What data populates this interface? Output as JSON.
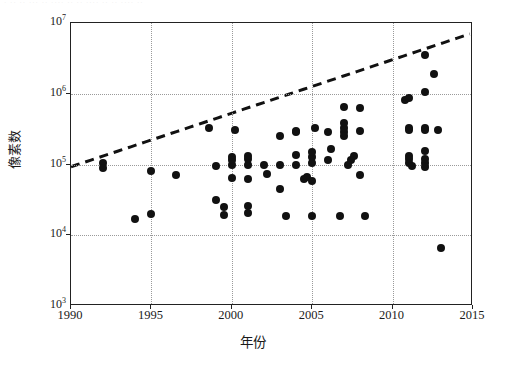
{
  "figure": {
    "scan_artifact_text": "· ·· ·· ··· ·· ···· ·· ·· ···· ·· ·· ···· ··",
    "title": "",
    "xlabel": "年份",
    "ylabel": "像素数"
  },
  "axis": {
    "x_ticks": [
      "1990",
      "1995",
      "2000",
      "2005",
      "2010",
      "2015"
    ],
    "y_ticks": [
      {
        "mantissa": "10",
        "exponent": "7"
      },
      {
        "mantissa": "10",
        "exponent": "6"
      },
      {
        "mantissa": "10",
        "exponent": "5"
      },
      {
        "mantissa": "10",
        "exponent": "4"
      },
      {
        "mantissa": "10",
        "exponent": "3"
      }
    ]
  },
  "chart_data": {
    "type": "scatter",
    "title": "",
    "xlabel": "年份",
    "ylabel": "像素数",
    "xlim": [
      1990,
      2015
    ],
    "ylim": [
      1000,
      10000000
    ],
    "yscale": "log",
    "xscale": "linear",
    "grid": true,
    "legend": null,
    "marker": {
      "shape": "circle",
      "color": "#111111",
      "size": 8
    },
    "series": [
      {
        "name": "像素数",
        "points": [
          [
            1992,
            105000
          ],
          [
            1992,
            88000
          ],
          [
            1994,
            17000
          ],
          [
            1995,
            82000
          ],
          [
            1995,
            20000
          ],
          [
            1996.5,
            70000
          ],
          [
            1998.6,
            330000
          ],
          [
            1999,
            96000
          ],
          [
            1999,
            31000
          ],
          [
            1999.5,
            19500
          ],
          [
            1999.5,
            25000
          ],
          [
            2000,
            100000
          ],
          [
            2000,
            115000
          ],
          [
            2000,
            128000
          ],
          [
            2000,
            64000
          ],
          [
            2000.2,
            310000
          ],
          [
            2001,
            100000
          ],
          [
            2001,
            118000
          ],
          [
            2001,
            132000
          ],
          [
            2001,
            62000
          ],
          [
            2001,
            20500
          ],
          [
            2001,
            26000
          ],
          [
            2002,
            98000
          ],
          [
            2002.2,
            73000
          ],
          [
            2003,
            100000
          ],
          [
            2003,
            250000
          ],
          [
            2003,
            45000
          ],
          [
            2003.4,
            19000
          ],
          [
            2004,
            97000
          ],
          [
            2004,
            290000
          ],
          [
            2004,
            135000
          ],
          [
            2004,
            300000
          ],
          [
            2004.5,
            63000
          ],
          [
            2004.7,
            67000
          ],
          [
            2005,
            105000
          ],
          [
            2005,
            128000
          ],
          [
            2005,
            152000
          ],
          [
            2005,
            59000
          ],
          [
            2005,
            19000
          ],
          [
            2005.2,
            330000
          ],
          [
            2006,
            290000
          ],
          [
            2006,
            115000
          ],
          [
            2006.2,
            168000
          ],
          [
            2006.7,
            18500
          ],
          [
            2007,
            640000
          ],
          [
            2007,
            290000
          ],
          [
            2007,
            330000
          ],
          [
            2007,
            380000
          ],
          [
            2007,
            250000
          ],
          [
            2007.2,
            100000
          ],
          [
            2007.4,
            115000
          ],
          [
            2007.6,
            132000
          ],
          [
            2008,
            620000
          ],
          [
            2008,
            300000
          ],
          [
            2008,
            70000
          ],
          [
            2008.3,
            18500
          ],
          [
            2010.8,
            820000
          ],
          [
            2011,
            880000
          ],
          [
            2011,
            330000
          ],
          [
            2011,
            310000
          ],
          [
            2011,
            105000
          ],
          [
            2011,
            118000
          ],
          [
            2011,
            132000
          ],
          [
            2011.2,
            95000
          ],
          [
            2012,
            3500000
          ],
          [
            2012,
            1050000
          ],
          [
            2012,
            330000
          ],
          [
            2012,
            310000
          ],
          [
            2012,
            155000
          ],
          [
            2012,
            105000
          ],
          [
            2012,
            118000
          ],
          [
            2012,
            92000
          ],
          [
            2012.6,
            1900000
          ],
          [
            2012.8,
            310000
          ],
          [
            2013,
            6500
          ]
        ]
      }
    ],
    "trendline": {
      "style": "dashed",
      "color": "#111111",
      "width": 3,
      "description": "exponential growth trend",
      "x_start": 1990,
      "y_start": 93000,
      "x_end": 2014.8,
      "y_end": 7000000
    }
  }
}
